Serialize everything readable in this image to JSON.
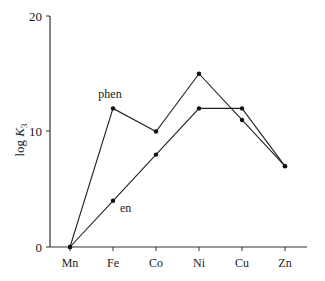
{
  "chart_data": {
    "type": "line",
    "title": "",
    "xlabel": "",
    "ylabel": "log K3",
    "ylabel_main": "log ",
    "ylabel_k": "K",
    "ylabel_sub": "3",
    "categories": [
      "Mn",
      "Fe",
      "Co",
      "Ni",
      "Cu",
      "Zn"
    ],
    "ylim": [
      0,
      20
    ],
    "yticks": [
      "0",
      "10",
      "20"
    ],
    "grid": false,
    "series": [
      {
        "name": "phen",
        "values": [
          0,
          12,
          10,
          15,
          11,
          7
        ]
      },
      {
        "name": "en",
        "values": [
          0,
          4,
          8,
          12,
          12,
          7
        ]
      }
    ],
    "annotations": [
      "phen",
      "en"
    ]
  }
}
